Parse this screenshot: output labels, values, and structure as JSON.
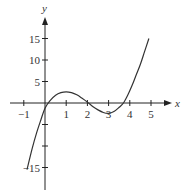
{
  "chart_data": {
    "type": "line",
    "title": "",
    "xlabel": "x",
    "ylabel": "y",
    "xlim": [
      -1.2,
      5.8
    ],
    "ylim": [
      -17,
      19
    ],
    "grid": false,
    "x_ticks": [
      -1,
      1,
      2,
      3,
      4,
      5
    ],
    "x_tick_labels": [
      "−1",
      "1",
      "2",
      "3",
      "4",
      "5"
    ],
    "y_ticks": [
      15,
      10,
      5,
      -5,
      -10,
      -15
    ],
    "y_tick_labels": [
      "15",
      "10",
      "5",
      "",
      "",
      "−15"
    ],
    "series": [
      {
        "name": "f(x)",
        "x": [
          -0.85,
          -0.6,
          -0.4,
          -0.2,
          0,
          0.25,
          0.5,
          0.75,
          1,
          1.25,
          1.5,
          1.75,
          2,
          2.25,
          2.5,
          2.75,
          3,
          3.25,
          3.5,
          3.7,
          3.9,
          4.1,
          4.3,
          4.5,
          4.7,
          4.9
        ],
        "y": [
          -15.5,
          -10.5,
          -7,
          -4,
          -1.2,
          0.6,
          1.8,
          2.4,
          2.6,
          2.4,
          1.9,
          1.1,
          0.2,
          -0.8,
          -1.6,
          -2.2,
          -2.4,
          -2,
          -1,
          0,
          1.8,
          4,
          6.5,
          9,
          12,
          15
        ]
      }
    ]
  },
  "colors": {
    "axis": "#222222",
    "curve": "#333333"
  }
}
